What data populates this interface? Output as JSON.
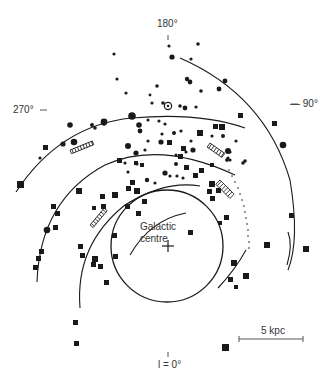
{
  "figure": {
    "title": "",
    "labels": {
      "l180": "180°",
      "l270": "270°",
      "l90": "— 90°",
      "l0": "l = 0°",
      "centre_line1": "Galactic",
      "centre_line2": "centre",
      "scale": "5 kpc"
    },
    "colors": {
      "ink": "#1a1a1a",
      "text": "#333333",
      "background": "#ffffff"
    },
    "legend_symbols": {
      "circle": "filled-circle",
      "square": "filled-square",
      "sun": "circled-dot",
      "hatched": "hatched-bar"
    }
  }
}
